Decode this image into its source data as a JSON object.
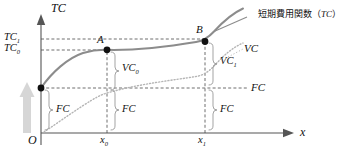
{
  "figure": {
    "title_note": "短期費用関数（TC）のグラフ",
    "axes": {
      "y_axis_label": "TC",
      "x_axis_label": "x",
      "origin_label": "O"
    },
    "y_ticks": [
      {
        "id": "tc1",
        "label": "TC",
        "sub": "1"
      },
      {
        "id": "tc0",
        "label": "TC",
        "sub": "0"
      }
    ],
    "x_ticks": [
      {
        "id": "x0",
        "label": "x",
        "sub": "0"
      },
      {
        "id": "x1",
        "label": "x",
        "sub": "1"
      }
    ],
    "points": [
      {
        "id": "A",
        "label": "A"
      },
      {
        "id": "B",
        "label": "B"
      }
    ],
    "curve_labels": {
      "tc_curve": {
        "text": "短期費用関数（",
        "italic": "TC",
        "tail": "）"
      },
      "vc_curve": "VC",
      "fc_line": "FC"
    },
    "brackets": [
      {
        "id": "vc0",
        "label": "VC",
        "sub": "0"
      },
      {
        "id": "vc1",
        "label": "VC",
        "sub": "1"
      },
      {
        "id": "fc_left",
        "label": "FC",
        "sub": ""
      },
      {
        "id": "fc_mid",
        "label": "FC",
        "sub": ""
      },
      {
        "id": "fc_right",
        "label": "FC",
        "sub": ""
      }
    ],
    "arrow": {
      "id": "fc-shift-arrow",
      "name": "vertical-gray-arrow"
    },
    "colors": {
      "axis": "#555555",
      "tc_curve": "#8c8c8c",
      "vc_curve": "#b0b0b0",
      "dashed": "#4a4a4a",
      "bracket": "#999999",
      "gray_arrow": "#d4d4d4",
      "text": "#111111"
    }
  }
}
